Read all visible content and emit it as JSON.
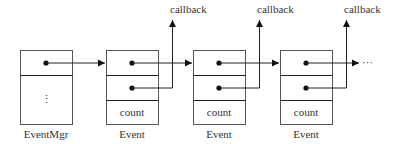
{
  "diagram": {
    "event_mgr": {
      "label": "EventMgr",
      "ellipsis": "⋮"
    },
    "events": [
      {
        "label": "Event",
        "field": "count",
        "callback_label": "callback"
      },
      {
        "label": "Event",
        "field": "count",
        "callback_label": "callback"
      },
      {
        "label": "Event",
        "field": "count",
        "callback_label": "callback"
      }
    ],
    "continuation": "···"
  }
}
